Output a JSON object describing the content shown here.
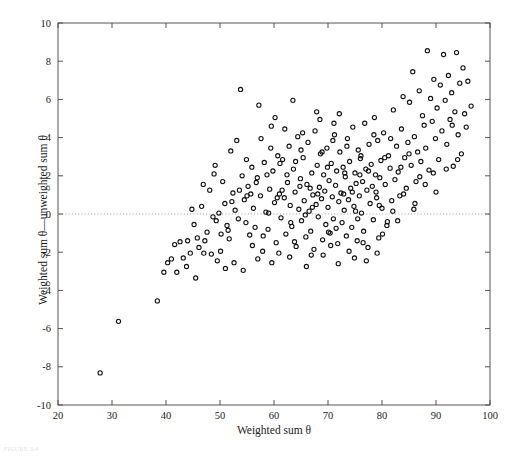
{
  "chart_data": {
    "type": "scatter",
    "title": "",
    "xlabel": "Weighted sum θ",
    "ylabel": "Weighted sum θ—unweighted sum θ",
    "xlim": [
      20,
      100
    ],
    "ylim": [
      -10,
      10
    ],
    "xticks": [
      20,
      30,
      40,
      50,
      60,
      70,
      80,
      90,
      100
    ],
    "yticks": [
      -10,
      -8,
      -6,
      -4,
      -2,
      0,
      2,
      4,
      6,
      8,
      10
    ],
    "xtick_labels": [
      "20",
      "30",
      "40",
      "50",
      "60",
      "70",
      "80",
      "90",
      "100"
    ],
    "ytick_labels": [
      "-10",
      "-8",
      "-6",
      "-4",
      "-2",
      "0",
      "2",
      "4",
      "6",
      "8",
      "10"
    ],
    "grid": false,
    "legend": null,
    "marker": {
      "shape": "circle",
      "filled": false,
      "edge_color": "#111111",
      "size": 4.2
    },
    "reference_lines": [
      {
        "orientation": "horizontal",
        "value": 0,
        "style": "dotted",
        "color": "#9a9a9a"
      }
    ],
    "axis_color": "#555555",
    "text_color": "#1a1a1a",
    "n_points": 301,
    "points": [
      [
        27.8,
        -8.32
      ],
      [
        31.2,
        -5.62
      ],
      [
        38.4,
        -4.55
      ],
      [
        39.6,
        -3.05
      ],
      [
        40.3,
        -2.55
      ],
      [
        41.0,
        -2.35
      ],
      [
        41.6,
        -1.6
      ],
      [
        42.6,
        -1.45
      ],
      [
        43.2,
        -2.3
      ],
      [
        44.0,
        -1.4
      ],
      [
        44.5,
        -2.05
      ],
      [
        45.2,
        -0.55
      ],
      [
        45.8,
        -1.25
      ],
      [
        46.1,
        -1.75
      ],
      [
        46.6,
        0.4
      ],
      [
        47.2,
        -1.4
      ],
      [
        47.6,
        -0.95
      ],
      [
        48.1,
        1.25
      ],
      [
        48.4,
        -2.1
      ],
      [
        48.9,
        2.1
      ],
      [
        49.3,
        -0.35
      ],
      [
        49.8,
        0.05
      ],
      [
        50.2,
        -1.05
      ],
      [
        50.5,
        1.7
      ],
      [
        50.9,
        0.55
      ],
      [
        51.3,
        -0.6
      ],
      [
        51.7,
        -1.3
      ],
      [
        52.0,
        3.3
      ],
      [
        52.4,
        1.1
      ],
      [
        52.8,
        0.2
      ],
      [
        53.1,
        3.85
      ],
      [
        53.4,
        -0.25
      ],
      [
        53.8,
        6.52
      ],
      [
        54.1,
        2.0
      ],
      [
        54.5,
        0.75
      ],
      [
        54.8,
        -0.45
      ],
      [
        55.2,
        1.45
      ],
      [
        55.5,
        -1.1
      ],
      [
        55.9,
        2.45
      ],
      [
        56.2,
        0.3
      ],
      [
        56.5,
        -0.7
      ],
      [
        56.9,
        1.9
      ],
      [
        57.2,
        5.7
      ],
      [
        57.5,
        0.95
      ],
      [
        57.9,
        -1.95
      ],
      [
        58.2,
        2.7
      ],
      [
        58.5,
        0.1
      ],
      [
        58.9,
        -0.8
      ],
      [
        59.2,
        1.3
      ],
      [
        59.5,
        4.6
      ],
      [
        59.8,
        2.25
      ],
      [
        60.1,
        0.6
      ],
      [
        60.4,
        -1.5
      ],
      [
        60.7,
        3.05
      ],
      [
        61.0,
        1.05
      ],
      [
        61.3,
        -0.2
      ],
      [
        61.6,
        2.85
      ],
      [
        61.9,
        0.85
      ],
      [
        62.2,
        -1.05
      ],
      [
        62.5,
        1.65
      ],
      [
        62.8,
        3.55
      ],
      [
        63.0,
        0.45
      ],
      [
        63.3,
        -0.65
      ],
      [
        63.6,
        2.35
      ],
      [
        63.9,
        1.15
      ],
      [
        64.1,
        -1.7
      ],
      [
        64.4,
        4.05
      ],
      [
        64.6,
        0.25
      ],
      [
        64.9,
        1.85
      ],
      [
        65.1,
        -0.35
      ],
      [
        65.4,
        2.95
      ],
      [
        65.6,
        0.7
      ],
      [
        65.9,
        -1.2
      ],
      [
        66.1,
        1.55
      ],
      [
        66.3,
        3.75
      ],
      [
        66.5,
        0.15
      ],
      [
        66.8,
        -0.9
      ],
      [
        67.0,
        2.15
      ],
      [
        67.2,
        1.0
      ],
      [
        67.4,
        -1.85
      ],
      [
        67.6,
        4.35
      ],
      [
        67.8,
        0.5
      ],
      [
        68.0,
        2.55
      ],
      [
        68.2,
        -0.15
      ],
      [
        68.4,
        1.4
      ],
      [
        68.6,
        3.15
      ],
      [
        68.8,
        0.8
      ],
      [
        69.0,
        -1.35
      ],
      [
        69.2,
        2.05
      ],
      [
        69.4,
        1.2
      ],
      [
        69.6,
        -0.55
      ],
      [
        69.8,
        3.45
      ],
      [
        70.0,
        0.35
      ],
      [
        70.2,
        1.75
      ],
      [
        70.4,
        -1.0
      ],
      [
        70.6,
        2.65
      ],
      [
        70.8,
        0.9
      ],
      [
        71.0,
        -0.25
      ],
      [
        71.2,
        4.15
      ],
      [
        71.4,
        1.5
      ],
      [
        71.6,
        2.25
      ],
      [
        71.8,
        -1.55
      ],
      [
        72.0,
        0.65
      ],
      [
        72.2,
        3.25
      ],
      [
        72.4,
        1.1
      ],
      [
        72.6,
        -0.45
      ],
      [
        72.8,
        2.45
      ],
      [
        73.0,
        0.2
      ],
      [
        73.2,
        1.95
      ],
      [
        73.4,
        -1.15
      ],
      [
        73.6,
        3.95
      ],
      [
        73.8,
        0.75
      ],
      [
        74.0,
        2.75
      ],
      [
        74.2,
        1.35
      ],
      [
        74.4,
        -0.7
      ],
      [
        74.6,
        4.55
      ],
      [
        74.8,
        0.4
      ],
      [
        75.0,
        2.15
      ],
      [
        75.2,
        1.6
      ],
      [
        75.4,
        -1.4
      ],
      [
        75.6,
        3.35
      ],
      [
        75.8,
        0.95
      ],
      [
        76.0,
        2.9
      ],
      [
        76.2,
        0.05
      ],
      [
        76.4,
        1.7
      ],
      [
        76.6,
        -0.9
      ],
      [
        76.8,
        4.75
      ],
      [
        77.0,
        2.35
      ],
      [
        77.2,
        1.25
      ],
      [
        77.4,
        -1.75
      ],
      [
        77.6,
        3.65
      ],
      [
        77.8,
        0.55
      ],
      [
        78.0,
        2.6
      ],
      [
        78.2,
        1.45
      ],
      [
        78.4,
        -0.3
      ],
      [
        78.6,
        5.05
      ],
      [
        78.8,
        2.05
      ],
      [
        79.0,
        0.85
      ],
      [
        79.2,
        3.85
      ],
      [
        79.4,
        -1.25
      ],
      [
        79.6,
        1.9
      ],
      [
        79.8,
        2.8
      ],
      [
        80.0,
        0.3
      ],
      [
        80.3,
        4.25
      ],
      [
        80.6,
        1.55
      ],
      [
        80.9,
        -0.6
      ],
      [
        81.2,
        3.05
      ],
      [
        81.5,
        2.4
      ],
      [
        81.8,
        0.7
      ],
      [
        82.1,
        5.45
      ],
      [
        82.4,
        1.8
      ],
      [
        82.7,
        3.55
      ],
      [
        83.0,
        2.2
      ],
      [
        83.3,
        0.95
      ],
      [
        83.6,
        4.45
      ],
      [
        83.9,
        6.15
      ],
      [
        84.2,
        2.95
      ],
      [
        84.5,
        1.35
      ],
      [
        84.8,
        3.75
      ],
      [
        85.1,
        5.85
      ],
      [
        85.4,
        2.55
      ],
      [
        85.7,
        7.45
      ],
      [
        86.0,
        4.05
      ],
      [
        86.3,
        1.7
      ],
      [
        86.6,
        3.25
      ],
      [
        86.9,
        6.45
      ],
      [
        87.2,
        2.75
      ],
      [
        87.5,
        5.15
      ],
      [
        87.8,
        4.65
      ],
      [
        88.1,
        3.45
      ],
      [
        88.4,
        8.55
      ],
      [
        88.7,
        2.3
      ],
      [
        89.0,
        6.05
      ],
      [
        89.3,
        4.85
      ],
      [
        89.6,
        7.05
      ],
      [
        89.9,
        3.95
      ],
      [
        90.2,
        5.55
      ],
      [
        90.5,
        2.85
      ],
      [
        90.8,
        6.75
      ],
      [
        91.1,
        4.35
      ],
      [
        91.4,
        8.35
      ],
      [
        91.7,
        5.95
      ],
      [
        92.0,
        3.65
      ],
      [
        92.3,
        7.25
      ],
      [
        92.6,
        4.95
      ],
      [
        92.9,
        6.35
      ],
      [
        93.2,
        2.5
      ],
      [
        93.5,
        5.35
      ],
      [
        93.8,
        8.45
      ],
      [
        94.1,
        4.15
      ],
      [
        94.4,
        6.85
      ],
      [
        94.7,
        3.15
      ],
      [
        95.0,
        7.65
      ],
      [
        95.3,
        5.25
      ],
      [
        95.6,
        4.55
      ],
      [
        95.9,
        6.95
      ],
      [
        48.7,
        -0.15
      ],
      [
        50.1,
        -1.95
      ],
      [
        52.6,
        -2.55
      ],
      [
        54.3,
        -2.95
      ],
      [
        55.7,
        1.05
      ],
      [
        57.0,
        -2.35
      ],
      [
        58.7,
        2.05
      ],
      [
        60.9,
        -2.05
      ],
      [
        62.0,
        4.45
      ],
      [
        63.8,
        -1.45
      ],
      [
        65.0,
        3.35
      ],
      [
        66.9,
        -2.15
      ],
      [
        68.5,
        4.95
      ],
      [
        70.5,
        -1.65
      ],
      [
        72.1,
        5.25
      ],
      [
        73.9,
        -1.95
      ],
      [
        75.1,
        0.15
      ],
      [
        77.1,
        -2.45
      ],
      [
        78.9,
        1.15
      ],
      [
        80.1,
        -1.05
      ],
      [
        44.8,
        0.25
      ],
      [
        46.9,
        1.55
      ],
      [
        49.1,
        2.55
      ],
      [
        51.5,
        -0.85
      ],
      [
        53.6,
        1.25
      ],
      [
        56.0,
        -1.65
      ],
      [
        59.0,
        0.05
      ],
      [
        61.1,
        2.65
      ],
      [
        64.8,
        1.45
      ],
      [
        67.1,
        0.35
      ],
      [
        69.9,
        2.45
      ],
      [
        71.5,
        -0.75
      ],
      [
        74.5,
        1.15
      ],
      [
        76.1,
        3.05
      ],
      [
        79.5,
        0.45
      ],
      [
        81.0,
        -0.4
      ],
      [
        59.6,
        -2.55
      ],
      [
        62.9,
        -2.25
      ],
      [
        66.0,
        -2.75
      ],
      [
        69.1,
        -2.15
      ],
      [
        71.9,
        -2.6
      ],
      [
        74.9,
        -2.3
      ],
      [
        58.0,
        -1.15
      ],
      [
        60.2,
        5.05
      ],
      [
        63.5,
        5.95
      ],
      [
        65.8,
        -0.05
      ],
      [
        68.1,
        1.05
      ],
      [
        70.9,
        3.85
      ],
      [
        73.1,
        2.15
      ],
      [
        76.5,
        -1.5
      ],
      [
        78.5,
        4.15
      ],
      [
        55.0,
        0.95
      ],
      [
        57.6,
        3.95
      ],
      [
        61.5,
        1.25
      ],
      [
        64.0,
        2.75
      ],
      [
        67.9,
        5.35
      ],
      [
        72.9,
        1.05
      ],
      [
        75.9,
        2.05
      ],
      [
        80.5,
        2.95
      ],
      [
        82.0,
        0.15
      ],
      [
        84.0,
        1.05
      ],
      [
        86.1,
        0.55
      ],
      [
        88.0,
        1.55
      ],
      [
        90.0,
        1.15
      ],
      [
        42.0,
        -3.05
      ],
      [
        43.8,
        -2.75
      ],
      [
        45.5,
        -3.35
      ],
      [
        47.0,
        -2.05
      ],
      [
        49.5,
        -2.45
      ],
      [
        51.0,
        -2.85
      ],
      [
        52.2,
        0.65
      ],
      [
        54.9,
        2.85
      ],
      [
        56.7,
        1.65
      ],
      [
        59.4,
        3.45
      ],
      [
        62.4,
        2.05
      ],
      [
        65.3,
        4.25
      ],
      [
        68.9,
        3.25
      ],
      [
        71.1,
        4.75
      ],
      [
        73.5,
        3.55
      ],
      [
        77.5,
        2.25
      ],
      [
        81.6,
        3.95
      ],
      [
        83.5,
        2.45
      ],
      [
        85.0,
        3.15
      ],
      [
        87.0,
        1.95
      ],
      [
        89.5,
        2.15
      ],
      [
        91.9,
        2.35
      ],
      [
        93.0,
        4.65
      ],
      [
        94.0,
        2.85
      ],
      [
        96.5,
        5.65
      ],
      [
        60.6,
        0.85
      ],
      [
        63.1,
        -0.45
      ],
      [
        66.7,
        1.35
      ],
      [
        70.1,
        -0.95
      ],
      [
        75.5,
        -0.25
      ],
      [
        79.1,
        -2.05
      ],
      [
        82.9,
        -0.35
      ],
      [
        85.9,
        0.25
      ]
    ]
  },
  "caption": "FIGURE 3.4"
}
